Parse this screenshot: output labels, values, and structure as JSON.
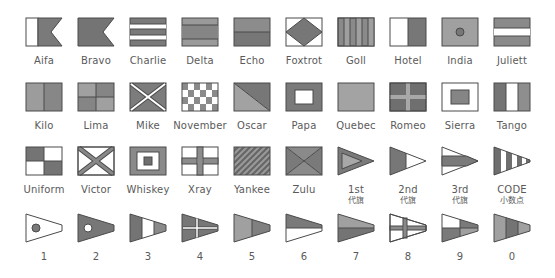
{
  "colors": {
    "dark": "#6f6f6f",
    "mid": "#8c8c8c",
    "light": "#a6a6a6",
    "white": "#ffffff",
    "outline": "#4a4a4a"
  },
  "rows": [
    {
      "flags": [
        {
          "label": "Aifa"
        },
        {
          "label": "Bravo"
        },
        {
          "label": "Charlie"
        },
        {
          "label": "Delta"
        },
        {
          "label": "Echo"
        },
        {
          "label": "Foxtrot"
        },
        {
          "label": "Goll"
        },
        {
          "label": "Hotel"
        },
        {
          "label": "India"
        },
        {
          "label": "Juliett"
        }
      ]
    },
    {
      "flags": [
        {
          "label": "Kilo"
        },
        {
          "label": "Lima"
        },
        {
          "label": "Mike"
        },
        {
          "label": "November"
        },
        {
          "label": "Oscar"
        },
        {
          "label": "Papa"
        },
        {
          "label": "Quebec"
        },
        {
          "label": "Romeo"
        },
        {
          "label": "Sierra"
        },
        {
          "label": "Tango"
        }
      ]
    },
    {
      "flags": [
        {
          "label": "Uniform"
        },
        {
          "label": "Victor"
        },
        {
          "label": "Whiskey"
        },
        {
          "label": "Xray"
        },
        {
          "label": "Yankee"
        },
        {
          "label": "Zulu"
        },
        {
          "label": "1st",
          "sub": "代旗"
        },
        {
          "label": "2nd",
          "sub": "代旗"
        },
        {
          "label": "3rd",
          "sub": "代旗"
        },
        {
          "label": "CODE",
          "sub": "小数点"
        }
      ]
    },
    {
      "flags": [
        {
          "label": "1"
        },
        {
          "label": "2"
        },
        {
          "label": "3"
        },
        {
          "label": "4"
        },
        {
          "label": "5"
        },
        {
          "label": "6"
        },
        {
          "label": "7"
        },
        {
          "label": "8"
        },
        {
          "label": "9"
        },
        {
          "label": "0"
        }
      ]
    }
  ]
}
